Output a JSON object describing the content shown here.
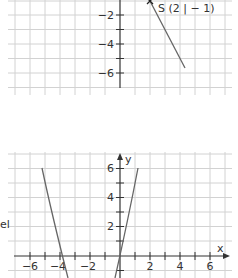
{
  "top_graph": {
    "point_label": "S (2 | − 1)",
    "y_tick_labels": [
      "−2",
      "−4",
      "−6"
    ],
    "line": {
      "from": [
        2,
        -1
      ],
      "to": [
        4.3,
        -5.6
      ]
    }
  },
  "bottom_graph": {
    "x_axis_label": "x",
    "y_axis_label": "y",
    "x_tick_labels": [
      "−6",
      "−4",
      "−2",
      "2",
      "4",
      "6"
    ],
    "y_tick_labels": [
      "6",
      "4",
      "2"
    ]
  },
  "side_text": "el",
  "colors": {
    "grid": "#d2d2d2",
    "axis": "#333333",
    "curve": "#666666"
  }
}
